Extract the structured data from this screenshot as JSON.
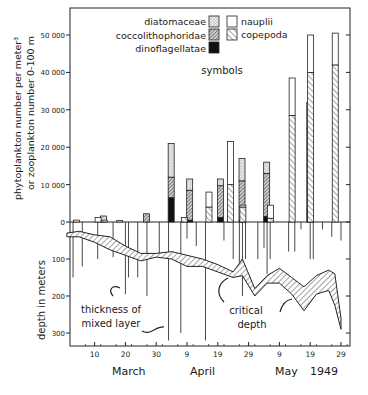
{
  "chart_data": {
    "type": "bar",
    "title": "",
    "subtitle": "",
    "xlabel": "",
    "month_labels": [
      "March",
      "April",
      "May"
    ],
    "year_label": "1949",
    "x_tick_labels": [
      "10",
      "20",
      "30",
      "9",
      "19",
      "29",
      "9",
      "19",
      "29"
    ],
    "ylabel_upper_line1": "phytoplankton number per meter³",
    "ylabel_upper_line2": "or zooplankton number 0-100 m",
    "ylabel_lower": "depth in meters",
    "y_upper_ticks": [
      "0",
      "10 000",
      "20 000",
      "30 000",
      "40 000",
      "50 000"
    ],
    "y_lower_ticks": [
      "100",
      "200",
      "300"
    ],
    "ylim_upper": [
      0,
      55000
    ],
    "ylim_lower": [
      0,
      350
    ],
    "legend": {
      "title": "symbols",
      "phyto": [
        {
          "name": "diatomaceae",
          "pattern": "stipple"
        },
        {
          "name": "coccolithophoridae",
          "pattern": "dense-hatch"
        },
        {
          "name": "dinoflagellatae",
          "pattern": "solid-black"
        }
      ],
      "zoo": [
        {
          "name": "nauplii",
          "pattern": "open"
        },
        {
          "name": "copepoda",
          "pattern": "diagonal-hatch"
        }
      ]
    },
    "annotations": [
      "thickness of mixed layer",
      "critical depth"
    ],
    "phyto_series": [
      {
        "date": "Mar 14",
        "day": 14,
        "dino": 0,
        "cocco": 0,
        "diatom": 1600
      },
      {
        "date": "Mar 28",
        "day": 28,
        "dino": 0,
        "cocco": 2200,
        "diatom": 0
      },
      {
        "date": "Apr 5",
        "day": 36,
        "dino": 6500,
        "cocco": 5500,
        "diatom": 9000
      },
      {
        "date": "Apr 11",
        "day": 42,
        "dino": 500,
        "cocco": 8000,
        "diatom": 3000
      },
      {
        "date": "Apr 21",
        "day": 52,
        "dino": 1200,
        "cocco": 8500,
        "diatom": 1800
      },
      {
        "date": "Apr 28",
        "day": 59,
        "dino": 500,
        "cocco": 10500,
        "diatom": 6000
      },
      {
        "date": "May 6",
        "day": 67,
        "dino": 1500,
        "cocco": 11500,
        "diatom": 3000
      },
      {
        "date": "May 20",
        "day": 81,
        "dino": 3500,
        "cocco": 21500,
        "diatom": 7000
      }
    ],
    "zoo_series": [
      {
        "date": "Mar 3",
        "day": 3,
        "copepoda": 0,
        "nauplii": 500
      },
      {
        "date": "Mar 10",
        "day": 10,
        "copepoda": 0,
        "nauplii": 1200
      },
      {
        "date": "Mar 12",
        "day": 12,
        "copepoda": 500,
        "nauplii": 0
      },
      {
        "date": "Mar 17",
        "day": 17,
        "copepoda": 0,
        "nauplii": 400
      },
      {
        "date": "Apr 7",
        "day": 38,
        "copepoda": 1200,
        "nauplii": 0
      },
      {
        "date": "Apr 15",
        "day": 46,
        "copepoda": 4000,
        "nauplii": 4000
      },
      {
        "date": "Apr 22",
        "day": 53,
        "copepoda": 10000,
        "nauplii": 11500
      },
      {
        "date": "Apr 26",
        "day": 57,
        "copepoda": 4000,
        "nauplii": 500
      },
      {
        "date": "May 5",
        "day": 66,
        "copepoda": 1000,
        "nauplii": 3500
      },
      {
        "date": "May 12",
        "day": 73,
        "copepoda": 28500,
        "nauplii": 10000
      },
      {
        "date": "May 18",
        "day": 79,
        "copepoda": 40000,
        "nauplii": 10000
      },
      {
        "date": "May 26",
        "day": 87,
        "copepoda": 42000,
        "nauplii": 8500
      }
    ],
    "mixed_layer_depths": [
      {
        "day": 3,
        "depth": 150
      },
      {
        "day": 6,
        "depth": 120
      },
      {
        "day": 11,
        "depth": 100
      },
      {
        "day": 16,
        "depth": 95
      },
      {
        "day": 20,
        "depth": 195
      },
      {
        "day": 21,
        "depth": 150
      },
      {
        "day": 24,
        "depth": 150
      },
      {
        "day": 27,
        "depth": 200
      },
      {
        "day": 31,
        "depth": 85
      },
      {
        "day": 34,
        "depth": 320
      },
      {
        "day": 38,
        "depth": 300
      },
      {
        "day": 40,
        "depth": 45
      },
      {
        "day": 43,
        "depth": 65
      },
      {
        "day": 46,
        "depth": 320
      },
      {
        "day": 52,
        "depth": 50
      },
      {
        "day": 55,
        "depth": 100
      },
      {
        "day": 57,
        "depth": 110
      },
      {
        "day": 58,
        "depth": 200
      },
      {
        "day": 59,
        "depth": 100
      },
      {
        "day": 63,
        "depth": 100
      },
      {
        "day": 65,
        "depth": 70
      },
      {
        "day": 66,
        "depth": 140
      },
      {
        "day": 67,
        "depth": 100
      },
      {
        "day": 73,
        "depth": 80
      },
      {
        "day": 75,
        "depth": 80
      },
      {
        "day": 77,
        "depth": 20
      },
      {
        "day": 80,
        "depth": 100
      },
      {
        "day": 81,
        "depth": 100
      },
      {
        "day": 84,
        "depth": 20
      },
      {
        "day": 87,
        "depth": 40
      },
      {
        "day": 90,
        "depth": 50
      }
    ],
    "critical_depth_band": {
      "upper": [
        [
          1,
          30
        ],
        [
          5,
          25
        ],
        [
          10,
          35
        ],
        [
          15,
          40
        ],
        [
          20,
          65
        ],
        [
          25,
          85
        ],
        [
          30,
          85
        ],
        [
          35,
          80
        ],
        [
          40,
          90
        ],
        [
          45,
          100
        ],
        [
          50,
          115
        ],
        [
          55,
          135
        ],
        [
          58,
          100
        ],
        [
          62,
          180
        ],
        [
          66,
          145
        ],
        [
          70,
          125
        ],
        [
          74,
          150
        ],
        [
          78,
          175
        ],
        [
          82,
          145
        ],
        [
          86,
          130
        ],
        [
          88,
          140
        ],
        [
          90,
          260
        ]
      ],
      "lower": [
        [
          1,
          40
        ],
        [
          5,
          40
        ],
        [
          10,
          55
        ],
        [
          15,
          75
        ],
        [
          20,
          90
        ],
        [
          25,
          105
        ],
        [
          30,
          95
        ],
        [
          35,
          100
        ],
        [
          40,
          120
        ],
        [
          45,
          120
        ],
        [
          50,
          135
        ],
        [
          55,
          150
        ],
        [
          58,
          145
        ],
        [
          62,
          200
        ],
        [
          66,
          165
        ],
        [
          70,
          165
        ],
        [
          74,
          195
        ],
        [
          78,
          240
        ],
        [
          82,
          195
        ],
        [
          86,
          185
        ],
        [
          88,
          225
        ],
        [
          90,
          290
        ]
      ]
    }
  }
}
